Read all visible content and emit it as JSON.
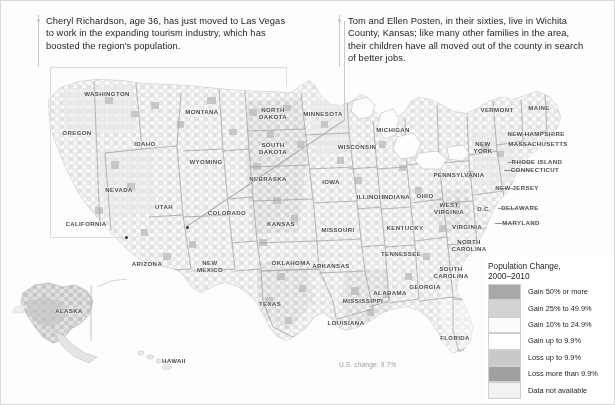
{
  "callouts": [
    {
      "id": "las-vegas",
      "name": "callout-las-vegas",
      "text": "Cheryl Richardson, age 36, has just moved to Las Vegas to work in the expanding tourism industry, which has boosted the region's population."
    },
    {
      "id": "wichita-county",
      "name": "callout-wichita-county",
      "text": "Tom and Ellen Posten, in their sixties, live in Wichita County, Kansas; like many other families in the area, their children have all moved out of the county in search of better jobs."
    }
  ],
  "annotation": {
    "us_change": "U.S. change: 9.7%"
  },
  "legend": {
    "title": "Population Change,\n2000–2010",
    "items": [
      {
        "label": "Gain 50% or more",
        "color": "#a8a8a8"
      },
      {
        "label": "Gain 25% to 49.9%",
        "color": "#d3d3d3"
      },
      {
        "label": "Gain 10% to 24.9%",
        "color": "#fbfbfb"
      },
      {
        "label": "Gain up to 9.9%",
        "color": "#ffffff"
      },
      {
        "label": "Loss up to 9.9%",
        "color": "#c9c9c9"
      },
      {
        "label": "Loss more than 9.9%",
        "color": "#a0a0a0"
      },
      {
        "label": "Data not available",
        "color": "#f2f2f2"
      }
    ]
  },
  "map": {
    "state_labels": [
      {
        "name": "washington",
        "text": "WASHINGTON",
        "x": 106,
        "y": 93
      },
      {
        "name": "oregon",
        "text": "OREGON",
        "x": 76,
        "y": 132
      },
      {
        "name": "idaho",
        "text": "IDAHO",
        "x": 144,
        "y": 143
      },
      {
        "name": "montana",
        "text": "MONTANA",
        "x": 201,
        "y": 111
      },
      {
        "name": "wyoming",
        "text": "WYOMING",
        "x": 205,
        "y": 161
      },
      {
        "name": "nevada",
        "text": "NEVADA",
        "x": 118,
        "y": 189
      },
      {
        "name": "utah",
        "text": "UTAH",
        "x": 163,
        "y": 206
      },
      {
        "name": "california",
        "text": "CALIFORNIA",
        "x": 85,
        "y": 223
      },
      {
        "name": "arizona",
        "text": "ARIZONA",
        "x": 146,
        "y": 263
      },
      {
        "name": "new-mexico",
        "text": "NEW\nMEXICO",
        "x": 209,
        "y": 266
      },
      {
        "name": "colorado",
        "text": "COLORADO",
        "x": 226,
        "y": 212
      },
      {
        "name": "north-dakota",
        "text": "NORTH\nDAKOTA",
        "x": 272,
        "y": 113
      },
      {
        "name": "south-dakota",
        "text": "SOUTH\nDAKOTA",
        "x": 272,
        "y": 148
      },
      {
        "name": "nebraska",
        "text": "NEBRASKA",
        "x": 267,
        "y": 178
      },
      {
        "name": "kansas",
        "text": "KANSAS",
        "x": 280,
        "y": 223
      },
      {
        "name": "oklahoma",
        "text": "OKLAHOMA",
        "x": 290,
        "y": 262
      },
      {
        "name": "texas",
        "text": "TEXAS",
        "x": 269,
        "y": 303
      },
      {
        "name": "minnesota",
        "text": "MINNESOTA",
        "x": 322,
        "y": 113
      },
      {
        "name": "iowa",
        "text": "IOWA",
        "x": 330,
        "y": 181
      },
      {
        "name": "missouri",
        "text": "MISSOURI",
        "x": 337,
        "y": 229
      },
      {
        "name": "arkansas",
        "text": "ARKANSAS",
        "x": 330,
        "y": 265
      },
      {
        "name": "louisiana",
        "text": "LOUISIANA",
        "x": 345,
        "y": 322
      },
      {
        "name": "wisconsin",
        "text": "WISCONSIN",
        "x": 356,
        "y": 146
      },
      {
        "name": "illinois",
        "text": "ILLINOIS",
        "x": 370,
        "y": 196
      },
      {
        "name": "michigan",
        "text": "MICHIGAN",
        "x": 392,
        "y": 129
      },
      {
        "name": "indiana",
        "text": "INDIANA",
        "x": 395,
        "y": 196
      },
      {
        "name": "ohio",
        "text": "OHIO",
        "x": 424,
        "y": 195
      },
      {
        "name": "kentucky",
        "text": "KENTUCKY",
        "x": 404,
        "y": 227
      },
      {
        "name": "tennessee",
        "text": "TENNESSEE",
        "x": 400,
        "y": 253
      },
      {
        "name": "mississippi",
        "text": "MISSISSIPPI",
        "x": 362,
        "y": 300
      },
      {
        "name": "alabama",
        "text": "ALABAMA",
        "x": 389,
        "y": 292
      },
      {
        "name": "georgia",
        "text": "GEORGIA",
        "x": 424,
        "y": 286
      },
      {
        "name": "florida",
        "text": "FLORIDA",
        "x": 454,
        "y": 337
      },
      {
        "name": "south-carolina",
        "text": "SOUTH\nCAROLINA",
        "x": 450,
        "y": 272
      },
      {
        "name": "north-carolina",
        "text": "NORTH\nCAROLINA",
        "x": 468,
        "y": 245
      },
      {
        "name": "virginia",
        "text": "VIRGINIA",
        "x": 466,
        "y": 226
      },
      {
        "name": "west-virginia",
        "text": "WEST\nVIRGINIA",
        "x": 448,
        "y": 208
      },
      {
        "name": "pennsylvania",
        "text": "PENNSYLVANIA",
        "x": 458,
        "y": 174
      },
      {
        "name": "new-york",
        "text": "NEW\nYORK",
        "x": 482,
        "y": 147
      },
      {
        "name": "vermont",
        "text": "VERMONT",
        "x": 496,
        "y": 109
      },
      {
        "name": "maine",
        "text": "MAINE",
        "x": 538,
        "y": 107
      },
      {
        "name": "dc",
        "text": "D.C.",
        "x": 483,
        "y": 208
      },
      {
        "name": "alaska",
        "text": "ALASKA",
        "x": 68,
        "y": 310
      },
      {
        "name": "hawaii",
        "text": "HAWAII",
        "x": 173,
        "y": 360
      }
    ],
    "leader_labels": [
      {
        "name": "new-hampshire",
        "text": "NEW HAMPSHIRE",
        "x": 535,
        "y": 133,
        "lx": 512,
        "ly": 133,
        "len": 19
      },
      {
        "name": "massachusetts",
        "text": "MASSACHUSETTS",
        "x": 537,
        "y": 143,
        "lx": 508,
        "ly": 143,
        "len": 25
      },
      {
        "name": "rhode-island",
        "text": "RHODE ISLAND",
        "x": 536,
        "y": 161,
        "lx": 507,
        "ly": 161,
        "len": 25
      },
      {
        "name": "connecticut",
        "text": "CONNECTICUT",
        "x": 534,
        "y": 169,
        "lx": 503,
        "ly": 169,
        "len": 27
      },
      {
        "name": "new-jersey",
        "text": "NEW JERSEY",
        "x": 516,
        "y": 187,
        "lx": 496,
        "ly": 187,
        "len": 16
      },
      {
        "name": "delaware",
        "text": "DELAWARE",
        "x": 519,
        "y": 207,
        "lx": 497,
        "ly": 207,
        "len": 18
      },
      {
        "name": "maryland",
        "text": "MARYLAND",
        "x": 520,
        "y": 222,
        "lx": 494,
        "ly": 222,
        "len": 22
      }
    ]
  }
}
